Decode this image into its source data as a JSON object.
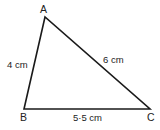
{
  "diagram": {
    "type": "triangle",
    "stroke_color": "#1a1a1a",
    "vertices": {
      "A": {
        "label": "A",
        "x": 45,
        "y": 17
      },
      "B": {
        "label": "B",
        "x": 24,
        "y": 109
      },
      "C": {
        "label": "C",
        "x": 150,
        "y": 109
      }
    },
    "sides": {
      "AB": {
        "label": "4 cm"
      },
      "AC": {
        "label": "6 cm"
      },
      "BC": {
        "label": "5·5 cm"
      }
    }
  }
}
